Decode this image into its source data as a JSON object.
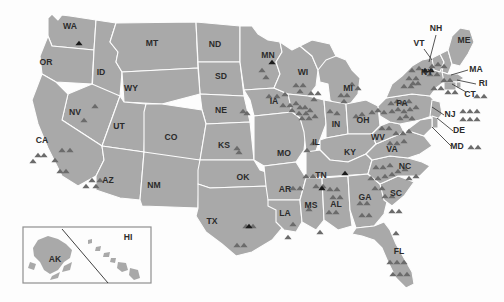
{
  "map": {
    "title": "United States distribution map",
    "colors": {
      "background": "#fdfdfd",
      "state_fill": "#a9a9a9",
      "state_border": "#fdfdfd",
      "label": "#2b2b2b",
      "marker_gray": "#6b6b6b",
      "marker_black": "#1a1a1a",
      "inset_border": "#8f8f8f",
      "leader_line": "#2b2b2b"
    },
    "marker_shape": "triangle",
    "state_labels": [
      {
        "code": "WA",
        "x": 70,
        "y": 27
      },
      {
        "code": "OR",
        "x": 46,
        "y": 63
      },
      {
        "code": "ID",
        "x": 101,
        "y": 73
      },
      {
        "code": "MT",
        "x": 152,
        "y": 44
      },
      {
        "code": "ND",
        "x": 215,
        "y": 45
      },
      {
        "code": "SD",
        "x": 221,
        "y": 77
      },
      {
        "code": "WY",
        "x": 131,
        "y": 89
      },
      {
        "code": "NV",
        "x": 75,
        "y": 113
      },
      {
        "code": "UT",
        "x": 119,
        "y": 127
      },
      {
        "code": "CO",
        "x": 171,
        "y": 138
      },
      {
        "code": "NE",
        "x": 221,
        "y": 111
      },
      {
        "code": "KS",
        "x": 224,
        "y": 146
      },
      {
        "code": "CA",
        "x": 42,
        "y": 141
      },
      {
        "code": "AZ",
        "x": 108,
        "y": 181
      },
      {
        "code": "NM",
        "x": 154,
        "y": 186
      },
      {
        "code": "OK",
        "x": 243,
        "y": 178
      },
      {
        "code": "TX",
        "x": 212,
        "y": 222
      },
      {
        "code": "MN",
        "x": 268,
        "y": 56
      },
      {
        "code": "IA",
        "x": 274,
        "y": 102
      },
      {
        "code": "WI",
        "x": 303,
        "y": 73
      },
      {
        "code": "MI",
        "x": 348,
        "y": 89
      },
      {
        "code": "MO",
        "x": 284,
        "y": 154
      },
      {
        "code": "IL",
        "x": 316,
        "y": 143
      },
      {
        "code": "IN",
        "x": 336,
        "y": 125
      },
      {
        "code": "OH",
        "x": 363,
        "y": 121
      },
      {
        "code": "KY",
        "x": 350,
        "y": 153
      },
      {
        "code": "TN",
        "x": 321,
        "y": 176
      },
      {
        "code": "AR",
        "x": 285,
        "y": 190
      },
      {
        "code": "MS",
        "x": 311,
        "y": 206
      },
      {
        "code": "AL",
        "x": 336,
        "y": 205
      },
      {
        "code": "LA",
        "x": 285,
        "y": 214
      },
      {
        "code": "GA",
        "x": 365,
        "y": 198
      },
      {
        "code": "FL",
        "x": 399,
        "y": 252
      },
      {
        "code": "SC",
        "x": 396,
        "y": 194
      },
      {
        "code": "NC",
        "x": 405,
        "y": 167
      },
      {
        "code": "VA",
        "x": 392,
        "y": 150
      },
      {
        "code": "WV",
        "x": 378,
        "y": 138
      },
      {
        "code": "PA",
        "x": 402,
        "y": 104
      },
      {
        "code": "NY",
        "x": 427,
        "y": 73
      },
      {
        "code": "VT",
        "x": 419,
        "y": 44
      },
      {
        "code": "NH",
        "x": 436,
        "y": 29
      },
      {
        "code": "ME",
        "x": 464,
        "y": 41
      },
      {
        "code": "MA",
        "x": 476,
        "y": 70
      },
      {
        "code": "RI",
        "x": 483,
        "y": 84
      },
      {
        "code": "CT",
        "x": 470,
        "y": 95
      },
      {
        "code": "NJ",
        "x": 450,
        "y": 115
      },
      {
        "code": "DE",
        "x": 459,
        "y": 131
      },
      {
        "code": "MD",
        "x": 457,
        "y": 147
      }
    ],
    "leader_lines": [
      {
        "name": "nh-leader",
        "x1": 436,
        "y1": 35,
        "x2": 429,
        "y2": 62
      },
      {
        "name": "vt-leader",
        "x1": 424,
        "y1": 49,
        "x2": 432,
        "y2": 60
      },
      {
        "name": "ma-leader",
        "x1": 468,
        "y1": 70,
        "x2": 451,
        "y2": 75
      },
      {
        "name": "ri-leader",
        "x1": 476,
        "y1": 84,
        "x2": 457,
        "y2": 80
      },
      {
        "name": "ct-leader",
        "x1": 466,
        "y1": 92,
        "x2": 452,
        "y2": 84
      },
      {
        "name": "nj-leader",
        "x1": 444,
        "y1": 115,
        "x2": 432,
        "y2": 107
      },
      {
        "name": "de-leader",
        "x1": 453,
        "y1": 131,
        "x2": 437,
        "y2": 118
      },
      {
        "name": "md-leader",
        "x1": 451,
        "y1": 146,
        "x2": 432,
        "y2": 127
      }
    ],
    "markers_gray": [
      [
        95,
        106
      ],
      [
        84,
        120
      ],
      [
        62,
        150
      ],
      [
        70,
        150
      ],
      [
        55,
        160
      ],
      [
        60,
        171
      ],
      [
        66,
        171
      ],
      [
        38,
        155
      ],
      [
        44,
        155
      ],
      [
        33,
        161
      ],
      [
        92,
        180
      ],
      [
        100,
        180
      ],
      [
        96,
        186
      ],
      [
        86,
        186
      ],
      [
        237,
        148
      ],
      [
        239,
        152
      ],
      [
        243,
        111
      ],
      [
        247,
        113
      ],
      [
        262,
        70
      ],
      [
        266,
        77
      ],
      [
        269,
        96
      ],
      [
        277,
        96
      ],
      [
        285,
        94
      ],
      [
        283,
        105
      ],
      [
        290,
        105
      ],
      [
        296,
        103
      ],
      [
        300,
        107
      ],
      [
        305,
        107
      ],
      [
        292,
        110
      ],
      [
        299,
        113
      ],
      [
        306,
        113
      ],
      [
        310,
        110
      ],
      [
        302,
        118
      ],
      [
        309,
        118
      ],
      [
        315,
        116
      ],
      [
        296,
        85
      ],
      [
        303,
        85
      ],
      [
        300,
        91
      ],
      [
        311,
        93
      ],
      [
        318,
        93
      ],
      [
        314,
        99
      ],
      [
        313,
        143
      ],
      [
        307,
        150
      ],
      [
        341,
        95
      ],
      [
        347,
        95
      ],
      [
        344,
        101
      ],
      [
        352,
        84
      ],
      [
        358,
        88
      ],
      [
        330,
        111
      ],
      [
        337,
        113
      ],
      [
        356,
        116
      ],
      [
        362,
        114
      ],
      [
        372,
        112
      ],
      [
        378,
        110
      ],
      [
        384,
        112
      ],
      [
        391,
        103
      ],
      [
        397,
        101
      ],
      [
        403,
        103
      ],
      [
        409,
        101
      ],
      [
        392,
        111
      ],
      [
        398,
        109
      ],
      [
        404,
        111
      ],
      [
        410,
        109
      ],
      [
        416,
        107
      ],
      [
        400,
        118
      ],
      [
        406,
        116
      ],
      [
        412,
        118
      ],
      [
        382,
        128
      ],
      [
        389,
        128
      ],
      [
        396,
        133
      ],
      [
        403,
        133
      ],
      [
        409,
        131
      ],
      [
        390,
        143
      ],
      [
        397,
        143
      ],
      [
        404,
        141
      ],
      [
        412,
        70
      ],
      [
        419,
        68
      ],
      [
        425,
        71
      ],
      [
        409,
        78
      ],
      [
        416,
        78
      ],
      [
        404,
        86
      ],
      [
        411,
        86
      ],
      [
        432,
        66
      ],
      [
        438,
        64
      ],
      [
        444,
        66
      ],
      [
        430,
        74
      ],
      [
        437,
        74
      ],
      [
        444,
        80
      ],
      [
        450,
        80
      ],
      [
        434,
        88
      ],
      [
        441,
        88
      ],
      [
        448,
        92
      ],
      [
        455,
        92
      ],
      [
        477,
        96
      ],
      [
        484,
        96
      ],
      [
        463,
        111
      ],
      [
        470,
        111
      ],
      [
        477,
        111
      ],
      [
        463,
        119
      ],
      [
        470,
        119
      ],
      [
        477,
        119
      ],
      [
        471,
        147
      ],
      [
        478,
        147
      ],
      [
        293,
        188
      ],
      [
        300,
        188
      ],
      [
        306,
        176
      ],
      [
        313,
        176
      ],
      [
        316,
        186
      ],
      [
        323,
        186
      ],
      [
        330,
        189
      ],
      [
        337,
        189
      ],
      [
        333,
        197
      ],
      [
        340,
        197
      ],
      [
        329,
        212
      ],
      [
        336,
        212
      ],
      [
        360,
        203
      ],
      [
        367,
        203
      ],
      [
        362,
        215
      ],
      [
        369,
        215
      ],
      [
        309,
        209
      ],
      [
        293,
        224
      ],
      [
        320,
        232
      ],
      [
        288,
        237
      ],
      [
        246,
        226
      ],
      [
        253,
        226
      ],
      [
        237,
        245
      ],
      [
        244,
        245
      ],
      [
        376,
        167
      ],
      [
        383,
        167
      ],
      [
        390,
        165
      ],
      [
        371,
        178
      ],
      [
        378,
        178
      ],
      [
        385,
        176
      ],
      [
        392,
        174
      ],
      [
        398,
        171
      ],
      [
        405,
        169
      ],
      [
        409,
        178
      ],
      [
        416,
        176
      ],
      [
        375,
        188
      ],
      [
        382,
        188
      ],
      [
        385,
        196
      ],
      [
        392,
        196
      ],
      [
        392,
        211
      ],
      [
        399,
        211
      ],
      [
        396,
        233
      ],
      [
        390,
        262
      ],
      [
        397,
        262
      ],
      [
        404,
        262
      ],
      [
        393,
        274
      ],
      [
        400,
        274
      ],
      [
        407,
        274
      ],
      [
        413,
        83
      ],
      [
        418,
        83
      ]
    ],
    "markers_black": [
      [
        79,
        43
      ],
      [
        272,
        62
      ],
      [
        345,
        173
      ],
      [
        322,
        188
      ],
      [
        249,
        226
      ],
      [
        425,
        70
      ],
      [
        431,
        70
      ]
    ]
  },
  "inset": {
    "name": "alaska-hawaii-inset",
    "labels": [
      {
        "code": "AK",
        "x": 55,
        "y": 260
      },
      {
        "code": "HI",
        "x": 128,
        "y": 238
      }
    ]
  }
}
